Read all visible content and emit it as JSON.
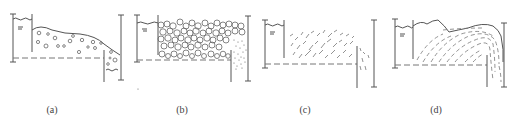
{
  "figure": {
    "panels": [
      {
        "id": "a",
        "label": "(a)",
        "description": "Sparse particles flowing over weir, water on both sides"
      },
      {
        "id": "b",
        "label": "(b)",
        "description": "Densely packed large particles with fine sediment downstream"
      },
      {
        "id": "c",
        "label": "(c)",
        "description": "Scattered elongated fragments flowing over weir"
      },
      {
        "id": "d",
        "label": "(d)",
        "description": "Streamlined dashed flow lines curving over downstream gate"
      }
    ],
    "colors": {
      "line": "#555555",
      "dash": "#777777",
      "background": "#ffffff"
    }
  }
}
